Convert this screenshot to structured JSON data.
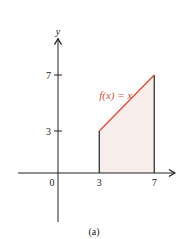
{
  "chart_data": {
    "type": "area",
    "title": "",
    "xlabel": "",
    "ylabel": "y",
    "origin_label": "0",
    "xlim": [
      -2.9,
      8.5
    ],
    "ylim": [
      -3.5,
      9.6
    ],
    "x_ticks": [
      {
        "value": 3,
        "label": "3"
      },
      {
        "value": 7,
        "label": "7"
      }
    ],
    "y_ticks": [
      {
        "value": 3,
        "label": "3"
      },
      {
        "value": 7,
        "label": "7"
      }
    ],
    "series": [
      {
        "name": "f(x) = x",
        "x": [
          3,
          7
        ],
        "y": [
          3,
          7
        ],
        "color": "#e0503a"
      }
    ],
    "shaded_region": {
      "x_from": 3,
      "x_to": 7,
      "under": "f(x) = x",
      "fill": "#f7eeec"
    },
    "annotations": [
      {
        "text": "f(x) = x",
        "x": 4.2,
        "y": 5.3,
        "color": "#e0503a"
      }
    ],
    "grid": false,
    "legend": "none",
    "caption": "(a)"
  },
  "colors": {
    "axis": "#222222",
    "curve": "#e0503a",
    "shade": "#f7eeec"
  }
}
